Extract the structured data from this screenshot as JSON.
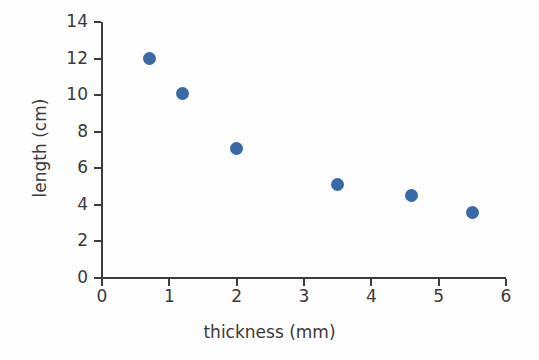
{
  "chart_data": {
    "type": "scatter",
    "title": "",
    "xlabel": "thickness (mm)",
    "ylabel": "length (cm)",
    "xlim": [
      0,
      6
    ],
    "ylim": [
      0,
      14
    ],
    "grid": false,
    "legend": null,
    "marker_color": "#3a69a8",
    "axis_color": "#3c3c3c",
    "background_color": "#fdfdfd",
    "xticks": [
      "0",
      "1",
      "2",
      "3",
      "4",
      "5",
      "6"
    ],
    "xtick_values": [
      0,
      1,
      2,
      3,
      4,
      5,
      6
    ],
    "yticks": [
      "0",
      "2",
      "4",
      "6",
      "8",
      "10",
      "12",
      "14"
    ],
    "ytick_values": [
      0,
      2,
      4,
      6,
      8,
      10,
      12,
      14
    ],
    "series": [
      {
        "name": "measurements",
        "points": [
          {
            "x": 0.7,
            "y": 12.0
          },
          {
            "x": 1.2,
            "y": 10.1
          },
          {
            "x": 2.0,
            "y": 7.1
          },
          {
            "x": 3.5,
            "y": 5.1
          },
          {
            "x": 4.6,
            "y": 4.5
          },
          {
            "x": 5.5,
            "y": 3.6
          }
        ]
      }
    ]
  }
}
